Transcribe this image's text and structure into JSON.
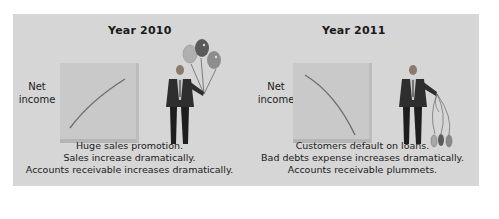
{
  "panels": [
    {
      "year": "Year 2010",
      "ylabel_line1": "Net",
      "ylabel_line2": "income",
      "trend": "increasing",
      "figure": "businessman-holding-inflated-balloons",
      "captions": [
        "Huge sales promotion.",
        "Sales increase dramatically.",
        "Accounts receivable increases dramatically."
      ]
    },
    {
      "year": "Year 2011",
      "ylabel_line1": "Net",
      "ylabel_line2": "income",
      "trend": "decreasing",
      "figure": "businessman-holding-deflated-balloons",
      "captions": [
        "Customers default on loans.",
        "Bad debts expense increases dramatically.",
        "Accounts receivable plummets."
      ]
    }
  ],
  "colors": {
    "panel_bg": "#d6d6d6",
    "chart_bg": "#c9c9c9",
    "curve": "#6e6e6e",
    "text": "#1a1a1a"
  }
}
